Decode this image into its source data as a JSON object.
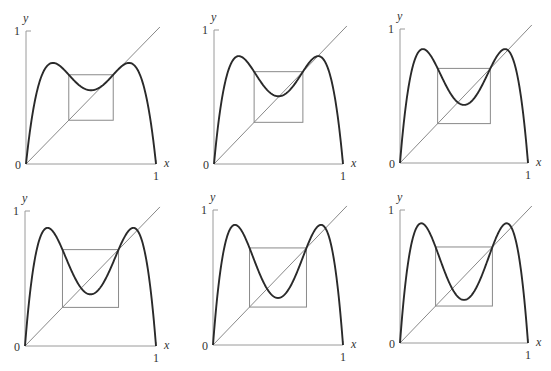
{
  "figure": {
    "labels": {
      "x": "x",
      "y": "y",
      "zero": "0",
      "one": "1"
    }
  },
  "chart_data": [
    {
      "type": "line",
      "title": "",
      "xlabel": "x",
      "ylabel": "y",
      "xlim": [
        0,
        1
      ],
      "ylim": [
        0,
        1
      ],
      "tick_labels": {
        "x": [
          "0",
          "1"
        ],
        "y": [
          "0",
          "1"
        ]
      },
      "r": 3.04,
      "series": [
        {
          "name": "f(f(x))",
          "peak_y": 0.76,
          "center_min_y": 0.55
        },
        {
          "name": "diagonal y=x"
        },
        {
          "name": "box",
          "x0": 0.329,
          "x1": 0.671,
          "y0": 0.329,
          "y1": 0.671
        }
      ],
      "panel": {
        "ox": 26,
        "oy": 164,
        "w": 130,
        "h": 133
      }
    },
    {
      "type": "line",
      "title": "",
      "xlabel": "x",
      "ylabel": "y",
      "xlim": [
        0,
        1
      ],
      "ylim": [
        0,
        1
      ],
      "tick_labels": {
        "x": [
          "0",
          "1"
        ],
        "y": [
          "0",
          "1"
        ]
      },
      "r": 3.22,
      "series": [
        {
          "name": "f(f(x))",
          "peak_y": 0.805,
          "center_min_y": 0.51
        },
        {
          "name": "diagonal y=x"
        },
        {
          "name": "box",
          "x0": 0.311,
          "x1": 0.689,
          "y0": 0.311,
          "y1": 0.689
        }
      ],
      "panel": {
        "ox": 214,
        "oy": 164,
        "w": 129,
        "h": 134
      }
    },
    {
      "type": "line",
      "title": "",
      "xlabel": "x",
      "ylabel": "y",
      "xlim": [
        0,
        1
      ],
      "ylim": [
        0,
        1
      ],
      "tick_labels": {
        "x": [
          "0",
          "1"
        ],
        "y": [
          "0",
          "1"
        ]
      },
      "r": 3.4,
      "series": [
        {
          "name": "f(f(x))",
          "peak_y": 0.85,
          "center_min_y": 0.43
        },
        {
          "name": "diagonal y=x"
        },
        {
          "name": "box",
          "x0": 0.294,
          "x1": 0.706,
          "y0": 0.294,
          "y1": 0.706
        }
      ],
      "panel": {
        "ox": 400,
        "oy": 163,
        "w": 128,
        "h": 134
      }
    },
    {
      "type": "line",
      "title": "",
      "xlabel": "x",
      "ylabel": "y",
      "xlim": [
        0,
        1
      ],
      "ylim": [
        0,
        1
      ],
      "tick_labels": {
        "x": [
          "0",
          "1"
        ],
        "y": [
          "0",
          "1"
        ]
      },
      "r": 3.5,
      "series": [
        {
          "name": "f(f(x))",
          "peak_y": 0.875,
          "center_min_y": 0.38
        },
        {
          "name": "diagonal y=x"
        },
        {
          "name": "box",
          "x0": 0.286,
          "x1": 0.714,
          "y0": 0.286,
          "y1": 0.714
        }
      ],
      "panel": {
        "ox": 25,
        "oy": 346,
        "w": 131,
        "h": 135
      }
    },
    {
      "type": "line",
      "title": "",
      "xlabel": "x",
      "ylabel": "y",
      "xlim": [
        0,
        1
      ],
      "ylim": [
        0,
        1
      ],
      "tick_labels": {
        "x": [
          "0",
          "1"
        ],
        "y": [
          "0",
          "1"
        ]
      },
      "r": 3.56,
      "series": [
        {
          "name": "f(f(x))",
          "peak_y": 0.89,
          "center_min_y": 0.35
        },
        {
          "name": "diagonal y=x"
        },
        {
          "name": "box",
          "x0": 0.281,
          "x1": 0.719,
          "y0": 0.281,
          "y1": 0.719
        }
      ],
      "panel": {
        "ox": 213,
        "oy": 345,
        "w": 130,
        "h": 135
      }
    },
    {
      "type": "line",
      "title": "",
      "xlabel": "x",
      "ylabel": "y",
      "xlim": [
        0,
        1
      ],
      "ylim": [
        0,
        1
      ],
      "tick_labels": {
        "x": [
          "0",
          "1"
        ],
        "y": [
          "0",
          "1"
        ]
      },
      "r": 3.6,
      "series": [
        {
          "name": "f(f(x))",
          "peak_y": 0.9,
          "center_min_y": 0.32
        },
        {
          "name": "diagonal y=x"
        },
        {
          "name": "box",
          "x0": 0.278,
          "x1": 0.722,
          "y0": 0.278,
          "y1": 0.722
        }
      ],
      "panel": {
        "ox": 400,
        "oy": 343,
        "w": 128,
        "h": 133
      }
    }
  ]
}
